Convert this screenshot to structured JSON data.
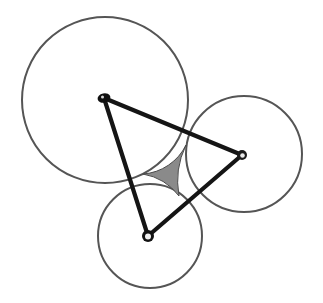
{
  "figure": {
    "background_color": "#ffffff",
    "width": 323,
    "height": 303
  },
  "style": {
    "circle_stroke_color": "#555555",
    "circle_stroke_width": 2.0,
    "circle_fill": "none",
    "edge_color": "#151515",
    "edge_width": 4.2,
    "region_fill_color": "#8a8a8a",
    "region_stroke_color": "#4a4a4a",
    "region_stroke_width": 1.0,
    "node_color": "#101010",
    "node_highlight_color": "#efefef",
    "node_radius": 5.0
  },
  "chart_data": {
    "type": "diagram",
    "circles": [
      {
        "name": "large-circle",
        "label": "A",
        "cx": 105,
        "cy": 100,
        "r": 83,
        "stroke": "#555555",
        "fill": "none"
      },
      {
        "name": "right-circle",
        "label": "B",
        "cx": 244,
        "cy": 154,
        "r": 58,
        "stroke": "#555555",
        "fill": "none"
      },
      {
        "name": "bottom-circle",
        "label": "C",
        "cx": 150,
        "cy": 236,
        "r": 52,
        "stroke": "#555555",
        "fill": "none"
      }
    ],
    "nodes": [
      {
        "name": "node-a",
        "label": "A",
        "x": 104,
        "y": 98
      },
      {
        "name": "node-b",
        "label": "B",
        "x": 242,
        "y": 155
      },
      {
        "name": "node-c",
        "label": "C",
        "x": 148,
        "y": 236
      }
    ],
    "edges": [
      {
        "name": "edge-ab",
        "from": "A",
        "to": "B"
      },
      {
        "name": "edge-bc",
        "from": "B",
        "to": "C"
      },
      {
        "name": "edge-ca",
        "from": "C",
        "to": "A"
      }
    ],
    "shaded_region": {
      "name": "triple-intersection",
      "fill": "#8a8a8a",
      "description": "Concave curvilinear triangle where all three circles overlap",
      "corners": [
        {
          "x": 186,
          "y": 145
        },
        {
          "x": 143,
          "y": 174
        },
        {
          "x": 179,
          "y": 196
        }
      ],
      "arc_paths": [
        {
          "from": 0,
          "to": 1,
          "arc_of": "bottom-circle"
        },
        {
          "from": 1,
          "to": 2,
          "arc_of": "right-circle"
        },
        {
          "from": 2,
          "to": 0,
          "arc_of": "large-circle"
        }
      ]
    },
    "legend": null,
    "axes": null,
    "grid": false
  }
}
